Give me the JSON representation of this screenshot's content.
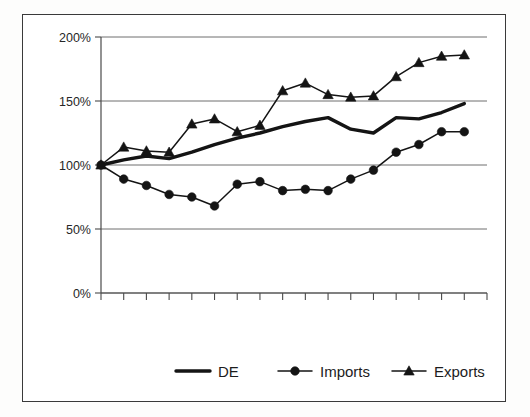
{
  "chart_data": {
    "type": "line",
    "title": "",
    "subtitle": "",
    "xlabel": "",
    "ylabel": "",
    "ylim": [
      0,
      200
    ],
    "yticks": [
      0,
      50,
      100,
      150,
      200
    ],
    "ytick_labels": [
      "0%",
      "50%",
      "100%",
      "150%",
      "200%"
    ],
    "grid": true,
    "xtick_labels": [],
    "x_axis_note": "unlabeled tick marks only",
    "n_points": 17,
    "x": [
      1,
      2,
      3,
      4,
      5,
      6,
      7,
      8,
      9,
      10,
      11,
      12,
      13,
      14,
      15,
      16,
      17
    ],
    "legend_position": "bottom",
    "series": [
      {
        "name": "DE",
        "marker": "none",
        "values": [
          100,
          104,
          107,
          105,
          110,
          116,
          121,
          125,
          130,
          134,
          137,
          128,
          125,
          137,
          136,
          141,
          148
        ]
      },
      {
        "name": "Imports",
        "marker": "circle",
        "values": [
          100,
          89,
          84,
          77,
          75,
          68,
          85,
          87,
          80,
          81,
          80,
          89,
          96,
          110,
          116,
          126,
          126
        ]
      },
      {
        "name": "Exports",
        "marker": "triangle",
        "values": [
          100,
          114,
          111,
          110,
          132,
          136,
          126,
          131,
          158,
          164,
          155,
          153,
          154,
          169,
          180,
          185,
          186
        ]
      }
    ]
  },
  "legend": {
    "items": [
      {
        "label": "DE",
        "marker": "none"
      },
      {
        "label": "Imports",
        "marker": "circle"
      },
      {
        "label": "Exports",
        "marker": "triangle"
      }
    ]
  },
  "colors": {
    "series_line": "#141414",
    "gridline": "#6f6f6f",
    "axis": "#4a4a4a",
    "frame": "#3a3a3a",
    "background": "#ffffff",
    "text": "#1c1c1c"
  }
}
